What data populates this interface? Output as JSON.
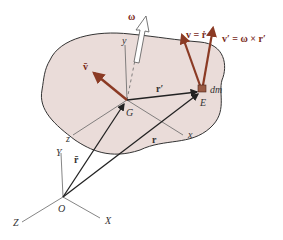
{
  "diagram": {
    "colors": {
      "body_fill": "#eadcd9",
      "outline": "#333333",
      "velocity_arrow": "#8b3a24",
      "position_arrow": "#222222",
      "axis": "#555555"
    },
    "labels": {
      "omega": "ω",
      "v_bar": "v̄",
      "v": "v = ṙ",
      "v_prime": "v′ = ω × r′",
      "dm": "dm",
      "E": "E",
      "G": "G",
      "r_prime": "r′",
      "r": "r",
      "r_bar": "r̄",
      "y_local": "y",
      "x_local": "x",
      "z_local": "z",
      "Y": "Y",
      "X": "X",
      "Z": "Z",
      "O": "O"
    }
  }
}
